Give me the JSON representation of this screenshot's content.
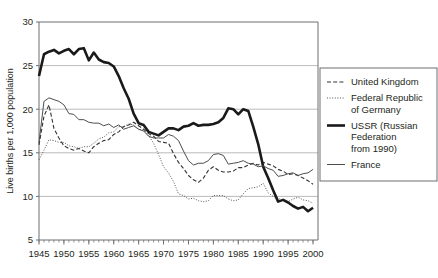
{
  "chart_data": {
    "type": "line",
    "title": "",
    "subtitle": "",
    "xlabel": "",
    "ylabel": "Live births per 1,000 population",
    "xlim": [
      1945,
      2001
    ],
    "ylim": [
      5,
      30
    ],
    "yticks": [
      5,
      10,
      15,
      20,
      25,
      30
    ],
    "ytick_labels": [
      "5",
      "10",
      "15",
      "20",
      "25",
      "30"
    ],
    "xticks": [
      1945,
      1950,
      1955,
      1960,
      1965,
      1970,
      1975,
      1980,
      1985,
      1990,
      1995,
      2000
    ],
    "xtick_labels": [
      "1945",
      "1950",
      "1955",
      "1960",
      "1965",
      "1970",
      "1975",
      "1980",
      "1985",
      "1990",
      "1995",
      "2000"
    ],
    "x_minor_tick_interval": 1,
    "grid": "horizontal",
    "grid_color": "#a8a8a8",
    "legend_position": "right-outside",
    "series": [
      {
        "name": "United Kingdom",
        "style": "dashed",
        "color": "#333333",
        "width": 1.1,
        "x": [
          1945,
          1946,
          1947,
          1948,
          1949,
          1950,
          1951,
          1952,
          1953,
          1954,
          1955,
          1956,
          1957,
          1958,
          1959,
          1960,
          1961,
          1962,
          1963,
          1964,
          1965,
          1966,
          1967,
          1968,
          1969,
          1970,
          1971,
          1972,
          1973,
          1974,
          1975,
          1976,
          1977,
          1978,
          1979,
          1980,
          1981,
          1982,
          1983,
          1984,
          1985,
          1986,
          1987,
          1988,
          1989,
          1990,
          1991,
          1992,
          1993,
          1994,
          1995,
          1996,
          1997,
          1998,
          1999,
          2000
        ],
        "values": [
          15.9,
          19.2,
          20.5,
          17.8,
          16.7,
          15.8,
          15.5,
          15.3,
          15.5,
          15.2,
          15.0,
          15.7,
          16.1,
          16.4,
          16.5,
          17.1,
          17.4,
          18.0,
          18.2,
          18.5,
          18.1,
          17.7,
          17.2,
          16.9,
          16.3,
          16.2,
          16.1,
          14.9,
          13.9,
          13.2,
          12.4,
          11.9,
          11.6,
          12.1,
          13.0,
          13.4,
          13.0,
          12.8,
          12.8,
          12.9,
          13.3,
          13.3,
          13.6,
          13.8,
          13.6,
          13.9,
          13.7,
          13.5,
          13.1,
          12.9,
          12.5,
          12.6,
          12.4,
          12.1,
          11.8,
          11.4
        ]
      },
      {
        "name": "Federal Republic of Germany",
        "style": "dotted",
        "color": "#555555",
        "width": 1.0,
        "x": [
          1945,
          1946,
          1947,
          1948,
          1949,
          1950,
          1951,
          1952,
          1953,
          1954,
          1955,
          1956,
          1957,
          1958,
          1959,
          1960,
          1961,
          1962,
          1963,
          1964,
          1965,
          1966,
          1967,
          1968,
          1969,
          1970,
          1971,
          1972,
          1973,
          1974,
          1975,
          1976,
          1977,
          1978,
          1979,
          1980,
          1981,
          1982,
          1983,
          1984,
          1985,
          1986,
          1987,
          1988,
          1989,
          1990,
          1991,
          1992,
          1993,
          1994,
          1995,
          1996,
          1997,
          1998,
          1999,
          2000
        ],
        "values": [
          14.2,
          15.3,
          16.5,
          16.4,
          16.2,
          16.2,
          15.8,
          15.7,
          15.5,
          15.7,
          15.7,
          16.1,
          16.6,
          16.8,
          17.3,
          17.4,
          18.0,
          18.0,
          18.3,
          18.2,
          17.7,
          17.6,
          17.0,
          16.1,
          14.8,
          13.4,
          12.7,
          11.7,
          10.3,
          10.1,
          9.7,
          9.8,
          9.5,
          9.4,
          9.5,
          10.1,
          10.1,
          10.1,
          9.7,
          9.5,
          9.6,
          10.3,
          10.9,
          11.0,
          11.1,
          11.5,
          10.4,
          10.0,
          9.8,
          9.5,
          9.4,
          9.7,
          9.9,
          9.6,
          9.5,
          9.2
        ]
      },
      {
        "name": "USSR (Russian Federation from 1990)",
        "style": "solid",
        "color": "#1a1a1a",
        "width": 2.6,
        "x": [
          1945,
          1946,
          1947,
          1948,
          1949,
          1950,
          1951,
          1952,
          1953,
          1954,
          1955,
          1956,
          1957,
          1958,
          1959,
          1960,
          1961,
          1962,
          1963,
          1964,
          1965,
          1966,
          1967,
          1968,
          1969,
          1970,
          1971,
          1972,
          1973,
          1974,
          1975,
          1976,
          1977,
          1978,
          1979,
          1980,
          1981,
          1982,
          1983,
          1984,
          1985,
          1986,
          1987,
          1988,
          1989,
          1990,
          1991,
          1992,
          1993,
          1994,
          1995,
          1996,
          1997,
          1998,
          1999,
          2000
        ],
        "values": [
          23.8,
          26.3,
          26.6,
          26.8,
          26.4,
          26.7,
          26.9,
          26.3,
          26.9,
          27.0,
          25.6,
          26.5,
          25.7,
          25.4,
          25.3,
          24.9,
          23.8,
          22.4,
          21.2,
          19.5,
          18.4,
          18.2,
          17.4,
          17.2,
          17.0,
          17.4,
          17.8,
          17.8,
          17.6,
          18.0,
          18.1,
          18.4,
          18.1,
          18.2,
          18.2,
          18.3,
          18.5,
          19.0,
          20.1,
          20.0,
          19.4,
          20.0,
          19.8,
          18.0,
          16.0,
          13.4,
          12.1,
          10.7,
          9.4,
          9.6,
          9.3,
          8.9,
          8.6,
          8.8,
          8.3,
          8.7
        ]
      },
      {
        "name": "France",
        "style": "solid",
        "color": "#4d4d4d",
        "width": 1.0,
        "x": [
          1945,
          1946,
          1947,
          1948,
          1949,
          1950,
          1951,
          1952,
          1953,
          1954,
          1955,
          1956,
          1957,
          1958,
          1959,
          1960,
          1961,
          1962,
          1963,
          1964,
          1965,
          1966,
          1967,
          1968,
          1969,
          1970,
          1971,
          1972,
          1973,
          1974,
          1975,
          1976,
          1977,
          1978,
          1979,
          1980,
          1981,
          1982,
          1983,
          1984,
          1985,
          1986,
          1987,
          1988,
          1989,
          1990,
          1991,
          1992,
          1993,
          1994,
          1995,
          1996,
          1997,
          1998,
          1999,
          2000
        ],
        "values": [
          16.2,
          20.9,
          21.3,
          21.1,
          20.9,
          20.5,
          19.5,
          19.4,
          18.8,
          18.8,
          18.5,
          18.4,
          18.4,
          18.1,
          18.3,
          17.9,
          18.2,
          17.7,
          17.9,
          18.1,
          17.7,
          17.5,
          16.9,
          16.7,
          16.7,
          16.7,
          17.1,
          16.9,
          16.4,
          15.2,
          14.1,
          13.6,
          13.8,
          13.8,
          14.1,
          14.8,
          14.9,
          14.7,
          13.7,
          13.8,
          13.9,
          14.1,
          13.8,
          13.7,
          13.4,
          13.5,
          13.2,
          13.0,
          12.3,
          12.4,
          12.6,
          12.7,
          12.4,
          12.6,
          12.7,
          13.1
        ]
      }
    ]
  },
  "legend": {
    "entries": [
      {
        "label": "United Kingdom",
        "style": "dashed"
      },
      {
        "label": "Federal Republic of Germany",
        "style": "dotted"
      },
      {
        "label": "USSR (Russian Federation from 1990)",
        "style": "thick-solid"
      },
      {
        "label": "France",
        "style": "solid"
      }
    ]
  },
  "axis": {
    "ylabel": "Live births per 1,000 population"
  },
  "colors": {
    "frame": "#6d6e71",
    "grid": "#a9aaac",
    "text": "#231f20",
    "background": "#ffffff"
  }
}
